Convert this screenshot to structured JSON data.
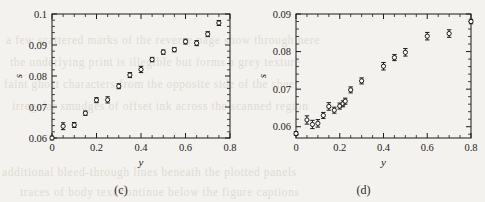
{
  "background": {
    "paper_color": "#f4f2ee",
    "bleed_text_color": "#cfcabf",
    "bleed_lines": [
      "a few scattered marks of the reverse page show through here",
      "the underlying print is illegible but forms a grey texture",
      "faint ghost characters from the opposite side of the sheet",
      "irregular smudges of offset ink across the scanned region",
      "additional bleed-through lines beneath the plotted panels",
      "traces of body text continue below the figure captions"
    ]
  },
  "figure": {
    "panels": [
      {
        "caption": "(c)",
        "chart_data": {
          "type": "scatter",
          "title": "",
          "xlabel": "y",
          "ylabel": "s",
          "xlim": [
            0,
            0.8
          ],
          "ylim": [
            0.06,
            0.1
          ],
          "xticks": [
            0,
            0.2,
            0.4,
            0.6,
            0.8
          ],
          "xticklabels": [
            "0",
            "0.2",
            "0.4",
            "0.6",
            "0.8"
          ],
          "yticks": [
            0.06,
            0.07,
            0.08,
            0.09,
            0.1
          ],
          "yticklabels": [
            "0.06",
            "0.07",
            "0.08",
            "0.09",
            "0.1"
          ],
          "minor_ticks": true,
          "grid": false,
          "legend": null,
          "marker": "open-circle-with-errorbars",
          "x": [
            0.0,
            0.05,
            0.1,
            0.15,
            0.2,
            0.25,
            0.3,
            0.35,
            0.4,
            0.45,
            0.5,
            0.55,
            0.6,
            0.65,
            0.7,
            0.75
          ],
          "y": [
            0.06,
            0.0638,
            0.0642,
            0.068,
            0.0722,
            0.0723,
            0.0767,
            0.0803,
            0.0821,
            0.0853,
            0.0877,
            0.0885,
            0.0911,
            0.0906,
            0.0935,
            0.0971
          ],
          "yerr": [
            0.0006,
            0.0011,
            0.0008,
            0.0007,
            0.0008,
            0.001,
            0.0008,
            0.0008,
            0.001,
            0.0007,
            0.0007,
            0.0007,
            0.0008,
            0.0008,
            0.0008,
            0.0008
          ]
        }
      },
      {
        "caption": "(d)",
        "chart_data": {
          "type": "scatter",
          "title": "",
          "xlabel": "y",
          "ylabel": "s",
          "xlim": [
            0,
            0.8
          ],
          "ylim": [
            0.057,
            0.09
          ],
          "xticks": [
            0,
            0.2,
            0.4,
            0.6,
            0.8
          ],
          "xticklabels": [
            "0",
            "0.2",
            "0.4",
            "0.6",
            "0.8"
          ],
          "yticks": [
            0.06,
            0.07,
            0.08,
            0.09
          ],
          "yticklabels": [
            "0.06",
            "0.07",
            "0.08",
            "0.09"
          ],
          "minor_ticks": true,
          "grid": false,
          "legend": null,
          "marker": "open-circle-with-errorbars",
          "x": [
            0.0,
            0.05,
            0.075,
            0.1,
            0.125,
            0.15,
            0.175,
            0.2,
            0.215,
            0.225,
            0.25,
            0.3,
            0.4,
            0.45,
            0.5,
            0.6,
            0.7,
            0.8
          ],
          "y": [
            0.0582,
            0.0618,
            0.0606,
            0.0609,
            0.063,
            0.0654,
            0.0644,
            0.0655,
            0.0661,
            0.0668,
            0.0698,
            0.0722,
            0.0761,
            0.0784,
            0.0798,
            0.0841,
            0.0848,
            0.088
          ],
          "yerr": [
            0.0005,
            0.0011,
            0.0011,
            0.001,
            0.0008,
            0.001,
            0.0008,
            0.0008,
            0.0008,
            0.0008,
            0.0008,
            0.0008,
            0.001,
            0.0008,
            0.001,
            0.001,
            0.001,
            0.0006
          ]
        }
      }
    ]
  }
}
